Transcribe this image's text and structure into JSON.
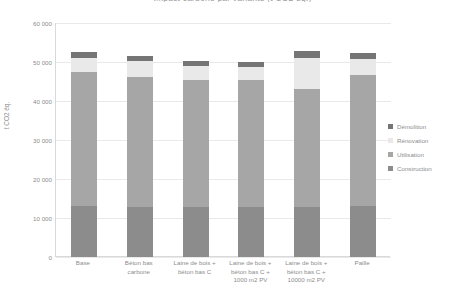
{
  "chart_data": {
    "type": "bar",
    "subtype": "stacked-bar",
    "title": "Impact carbone par variante (t CO2 éq.)",
    "xlabel": "",
    "ylabel": "t CO2 éq.",
    "ylim": [
      0,
      60000
    ],
    "ytick_step": 10000,
    "grid": true,
    "legend_position": "right",
    "ytick_labels": [
      "60 000",
      "50 000",
      "40 000",
      "30 000",
      "20 000",
      "10 000",
      "0"
    ],
    "ytick_values": [
      60000,
      50000,
      40000,
      30000,
      20000,
      10000,
      0
    ],
    "categories": [
      "Base",
      "Béton bas carbone",
      "Laine de bois + béton bas C",
      "Laine de bois + béton bas C + 1000 m2 PV",
      "Laine de bois + béton bas C + 10000 m2 PV",
      "Paille"
    ],
    "category_label_lines": [
      [
        "Base"
      ],
      [
        "Béton bas",
        "carbone"
      ],
      [
        "Laine de bois +",
        "béton bas C"
      ],
      [
        "Laine de bois +",
        "béton bas C +",
        "1000 m2 PV"
      ],
      [
        "Laine de bois +",
        "béton bas C +",
        "10000 m2 PV"
      ],
      [
        "Paille"
      ]
    ],
    "series": [
      {
        "name": "Construction",
        "color": "#8c8c8c",
        "values": [
          13000,
          12900,
          12900,
          12900,
          12900,
          13000
        ]
      },
      {
        "name": "Utilisation",
        "color": "#a6a6a6",
        "values": [
          34500,
          33300,
          32500,
          32400,
          30200,
          33800
        ]
      },
      {
        "name": "Rénovation",
        "color": "#e9e9e9",
        "values": [
          3500,
          4000,
          3500,
          3500,
          8000,
          4000
        ]
      },
      {
        "name": "Démolition",
        "color": "#757575",
        "values": [
          1500,
          1300,
          1300,
          1200,
          1700,
          1400
        ]
      }
    ],
    "totals": [
      52500,
      51500,
      50200,
      50000,
      52800,
      52200
    ]
  },
  "legend": {
    "items": [
      {
        "label": "Démolition",
        "color": "#757575"
      },
      {
        "label": "Rénovation",
        "color": "#e9e9e9"
      },
      {
        "label": "Utilisation",
        "color": "#a6a6a6"
      },
      {
        "label": "Construction",
        "color": "#8c8c8c"
      }
    ]
  },
  "axes": {
    "y_title": "t CO2 éq."
  }
}
